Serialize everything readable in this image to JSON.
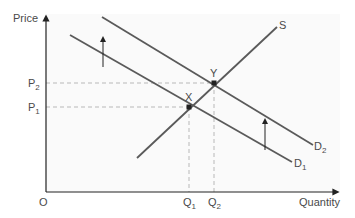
{
  "diagram": {
    "title": "",
    "axes": {
      "y_label": "Price",
      "x_label": "Quantity",
      "origin_label": "O"
    },
    "price_labels": [
      {
        "main": "P",
        "sub": "2"
      },
      {
        "main": "P",
        "sub": "1"
      }
    ],
    "quantity_labels": [
      {
        "main": "Q",
        "sub": "1"
      },
      {
        "main": "Q",
        "sub": "2"
      }
    ],
    "curves": {
      "supply": {
        "label": "S"
      },
      "demand_1": {
        "main": "D",
        "sub": "1"
      },
      "demand_2": {
        "main": "D",
        "sub": "2"
      }
    },
    "points": {
      "x": {
        "label": "X",
        "description": "Initial equilibrium (P1, Q1)"
      },
      "y": {
        "label": "Y",
        "description": "New equilibrium (P2, Q2)"
      }
    },
    "shift_arrows": [
      "Demand shift upward (left arrow)",
      "Demand shift upward (right arrow)"
    ],
    "colors": {
      "line": "#5a5a5a",
      "axis": "#222222",
      "dashed": "#b8b8b8",
      "text": "#4a4a4a",
      "plot_bg": "#fafafa"
    }
  }
}
